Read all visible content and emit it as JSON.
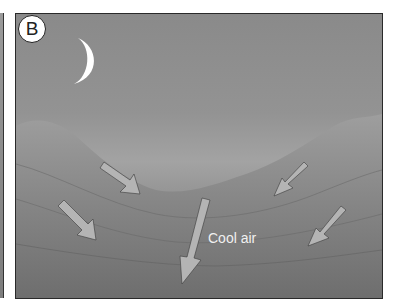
{
  "figure": {
    "panel_label": "B",
    "scene": "night valley",
    "annotation": "Cool air",
    "elements": [
      "crescent-moon",
      "mountain-slopes",
      "downslope-arrows"
    ],
    "arrow_count": 5,
    "colors": {
      "sky": "#8e8e8e",
      "terrain": "#7d7d7d",
      "arrow": "#b4b4b4",
      "moon": "#ffffff",
      "text": "#f0f0f0"
    }
  }
}
